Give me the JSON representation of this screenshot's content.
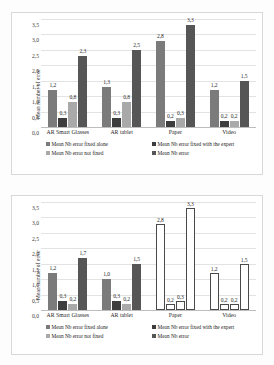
{
  "chart_data": [
    {
      "type": "bar",
      "id": "top",
      "title": "",
      "xlabel": "",
      "ylabel": "Mean number of error",
      "ylim": [
        0,
        3.5
      ],
      "ytick_labels": [
        "0,0",
        "0,5",
        "1,0",
        "1,5",
        "2,0",
        "2,5",
        "3,0",
        "3,5"
      ],
      "ytick_values": [
        0,
        0.5,
        1.0,
        1.5,
        2.0,
        2.5,
        3.0,
        3.5
      ],
      "grid": true,
      "legend_position": "bottom",
      "categories": [
        "AR Smart Glasses",
        "AR tablet",
        "Paper",
        "Video"
      ],
      "series": [
        {
          "name": "Mean Nb error fixed alone",
          "color": "#7b7b7b",
          "values": [
            1.2,
            1.3,
            2.8,
            1.2
          ],
          "labels": [
            "1,2",
            "1,3",
            "2,8",
            "1,2"
          ]
        },
        {
          "name": "Mean Nb error fixed with the expert",
          "color": "#3d3d3d",
          "values": [
            0.3,
            0.3,
            0.2,
            0.2
          ],
          "labels": [
            "0,3",
            "0,3",
            "0,2",
            "0,2"
          ]
        },
        {
          "name": "Mean Nb error not fixed",
          "color": "#a9a9a9",
          "values": [
            0.8,
            0.8,
            0.3,
            0.2
          ],
          "labels": [
            "0,8",
            "0,8",
            "0,3",
            "0,2"
          ]
        },
        {
          "name": "Mean Nb error",
          "color": "#565656",
          "values": [
            2.3,
            2.5,
            3.3,
            1.5
          ],
          "labels": [
            "2,3",
            "2,5",
            "3,3",
            "1,5"
          ]
        }
      ]
    },
    {
      "type": "bar",
      "id": "bottom",
      "title": "",
      "xlabel": "",
      "ylabel": "Mean number of error",
      "ylim": [
        0,
        3.5
      ],
      "ytick_labels": [
        "0,0",
        "0,5",
        "1,0",
        "1,5",
        "2,0",
        "2,5",
        "3,0",
        "3,5"
      ],
      "ytick_values": [
        0,
        0.5,
        1.0,
        1.5,
        2.0,
        2.5,
        3.0,
        3.5
      ],
      "grid": true,
      "legend_position": "bottom",
      "categories": [
        "AR Smart Glasses",
        "AR tablet",
        "Paper",
        "Video"
      ],
      "outlined_categories": [
        "Paper",
        "Video"
      ],
      "series": [
        {
          "name": "Mean Nb error fixed alone",
          "color": "#7b7b7b",
          "values": [
            1.2,
            1.0,
            2.8,
            1.2
          ],
          "labels": [
            "1,2",
            "1,0",
            "2,8",
            "1,2"
          ]
        },
        {
          "name": "Mean Nb error fixed with the expert",
          "color": "#3d3d3d",
          "values": [
            0.3,
            0.3,
            0.2,
            0.2
          ],
          "labels": [
            "0,3",
            "0,3",
            "0,2",
            "0,2"
          ]
        },
        {
          "name": "Mean Nb error not fixed",
          "color": "#a9a9a9",
          "values": [
            0.2,
            0.2,
            0.3,
            0.2
          ],
          "labels": [
            "0,2",
            "0,2",
            "0,3",
            "0,2"
          ]
        },
        {
          "name": "Mean Nb error",
          "color": "#565656",
          "values": [
            1.7,
            1.5,
            3.3,
            1.5
          ],
          "labels": [
            "1,7",
            "1,5",
            "3,3",
            "1,5"
          ]
        }
      ]
    }
  ]
}
